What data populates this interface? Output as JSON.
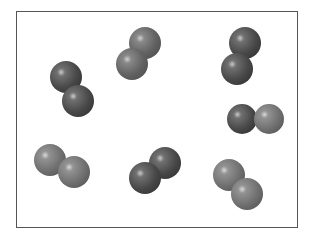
{
  "diagram": {
    "type": "particle-box",
    "frame": {
      "x": 16,
      "y": 11,
      "width": 282,
      "height": 217,
      "border_color": "#555555"
    },
    "colors": {
      "dark_atom": "#4a4a4a",
      "mid_atom": "#6a6a6a",
      "light_atom": "#7a7a7a",
      "highlight": "#d8d8d8"
    },
    "molecules": [
      {
        "id": "molecule-1",
        "atoms": [
          {
            "cx": 66,
            "cy": 77,
            "r": 16,
            "shade": "dark"
          },
          {
            "cx": 78,
            "cy": 101,
            "r": 16,
            "shade": "dark"
          }
        ]
      },
      {
        "id": "molecule-2",
        "atoms": [
          {
            "cx": 145,
            "cy": 43,
            "r": 16,
            "shade": "mid"
          },
          {
            "cx": 132,
            "cy": 64,
            "r": 16,
            "shade": "mid"
          }
        ]
      },
      {
        "id": "molecule-3",
        "atoms": [
          {
            "cx": 245,
            "cy": 43,
            "r": 16,
            "shade": "dark"
          },
          {
            "cx": 237,
            "cy": 69,
            "r": 16,
            "shade": "dark"
          }
        ]
      },
      {
        "id": "molecule-4",
        "atoms": [
          {
            "cx": 242,
            "cy": 119,
            "r": 15,
            "shade": "dark"
          },
          {
            "cx": 269,
            "cy": 119,
            "r": 15,
            "shade": "light"
          }
        ]
      },
      {
        "id": "molecule-5",
        "atoms": [
          {
            "cx": 50,
            "cy": 160,
            "r": 16,
            "shade": "light"
          },
          {
            "cx": 74,
            "cy": 172,
            "r": 16,
            "shade": "light"
          }
        ]
      },
      {
        "id": "molecule-6",
        "atoms": [
          {
            "cx": 165,
            "cy": 163,
            "r": 16,
            "shade": "dark"
          },
          {
            "cx": 145,
            "cy": 178,
            "r": 16,
            "shade": "dark"
          }
        ]
      },
      {
        "id": "molecule-7",
        "atoms": [
          {
            "cx": 229,
            "cy": 175,
            "r": 16,
            "shade": "light"
          },
          {
            "cx": 247,
            "cy": 194,
            "r": 16,
            "shade": "light"
          }
        ]
      }
    ]
  }
}
